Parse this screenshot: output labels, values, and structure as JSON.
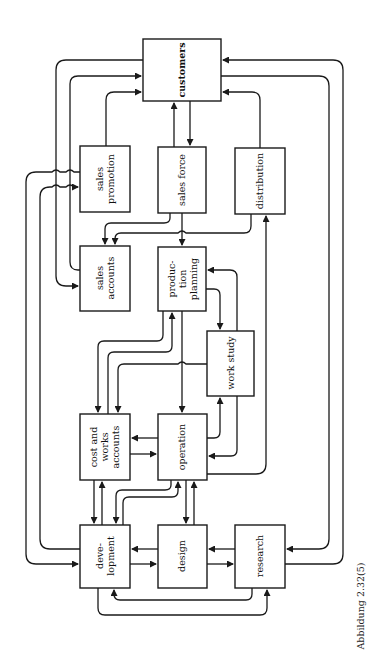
{
  "diagram": {
    "caption": "Abbildung 2.32(5)",
    "nodes": [
      {
        "id": "customers",
        "lines": [
          "customers"
        ]
      },
      {
        "id": "sales_promotion",
        "lines": [
          "sales",
          "promotion"
        ]
      },
      {
        "id": "sales_force",
        "lines": [
          "sales force"
        ]
      },
      {
        "id": "distribution",
        "lines": [
          "distribution"
        ]
      },
      {
        "id": "sales_accounts",
        "lines": [
          "sales",
          "accounts"
        ]
      },
      {
        "id": "production_planning",
        "lines": [
          "produc-",
          "tion",
          "planning"
        ]
      },
      {
        "id": "work_study",
        "lines": [
          "work study"
        ]
      },
      {
        "id": "cost_works_accounts",
        "lines": [
          "cost and",
          "works",
          "accounts"
        ]
      },
      {
        "id": "operation",
        "lines": [
          "operation"
        ]
      },
      {
        "id": "development",
        "lines": [
          "deve-",
          "lopment"
        ]
      },
      {
        "id": "design",
        "lines": [
          "design"
        ]
      },
      {
        "id": "research",
        "lines": [
          "research"
        ]
      }
    ],
    "edges": [
      {
        "from": "sales_force",
        "to": "customers"
      },
      {
        "from": "customers",
        "to": "sales_force"
      },
      {
        "from": "sales_promotion",
        "to": "customers"
      },
      {
        "from": "distribution",
        "to": "customers"
      },
      {
        "from": "sales_accounts",
        "to": "customers"
      },
      {
        "from": "customers",
        "to": "sales_accounts"
      },
      {
        "from": "customers",
        "to": "research"
      },
      {
        "from": "research",
        "to": "customers"
      },
      {
        "from": "sales_promotion",
        "to": "development"
      },
      {
        "from": "development",
        "to": "sales_promotion"
      },
      {
        "from": "sales_force",
        "to": "sales_accounts"
      },
      {
        "from": "distribution",
        "to": "sales_accounts"
      },
      {
        "from": "sales_force",
        "to": "production_planning"
      },
      {
        "from": "operation",
        "to": "distribution"
      },
      {
        "from": "production_planning",
        "to": "work_study"
      },
      {
        "from": "work_study",
        "to": "production_planning"
      },
      {
        "from": "production_planning",
        "to": "cost_works_accounts"
      },
      {
        "from": "cost_works_accounts",
        "to": "production_planning"
      },
      {
        "from": "work_study",
        "to": "cost_works_accounts"
      },
      {
        "from": "production_planning",
        "to": "operation"
      },
      {
        "from": "operation",
        "to": "work_study"
      },
      {
        "from": "work_study",
        "to": "operation"
      },
      {
        "from": "operation",
        "to": "cost_works_accounts"
      },
      {
        "from": "cost_works_accounts",
        "to": "operation"
      },
      {
        "from": "cost_works_accounts",
        "to": "development"
      },
      {
        "from": "development",
        "to": "cost_works_accounts"
      },
      {
        "from": "operation",
        "to": "development"
      },
      {
        "from": "development",
        "to": "operation"
      },
      {
        "from": "operation",
        "to": "design"
      },
      {
        "from": "design",
        "to": "operation"
      },
      {
        "from": "design",
        "to": "development"
      },
      {
        "from": "development",
        "to": "design"
      },
      {
        "from": "research",
        "to": "design"
      },
      {
        "from": "design",
        "to": "research"
      },
      {
        "from": "research",
        "to": "development"
      },
      {
        "from": "development",
        "to": "research"
      }
    ]
  },
  "colors": {
    "line": "#1a1a1a",
    "background": "#ffffff"
  }
}
